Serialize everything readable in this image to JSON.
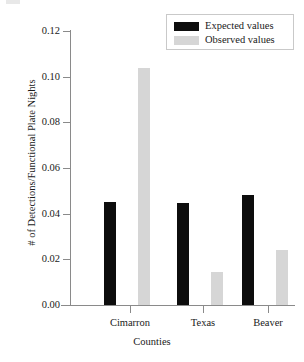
{
  "chart_data": {
    "type": "bar",
    "title": "",
    "xlabel": "Counties",
    "ylabel": "# of Detections/Functional Plate Nights",
    "categories": [
      "Cimarron",
      "Texas",
      "Beaver"
    ],
    "series": [
      {
        "name": "Expected values",
        "color": "#0d0d0d",
        "values": [
          0.045,
          0.0445,
          0.048
        ]
      },
      {
        "name": "Observed values",
        "color": "#d6d6d6",
        "values": [
          0.104,
          0.0145,
          0.024
        ]
      }
    ],
    "ylim": [
      0.0,
      0.12
    ],
    "yticks": [
      0.0,
      0.02,
      0.04,
      0.06,
      0.08,
      0.1,
      0.12
    ],
    "ytick_labels": [
      "0.00",
      "0.02",
      "0.04",
      "0.06",
      "0.08",
      "0.10",
      "0.12"
    ],
    "grid": false,
    "legend_position": "top-right",
    "legend_entries": [
      "Expected values",
      "Observed values"
    ]
  }
}
